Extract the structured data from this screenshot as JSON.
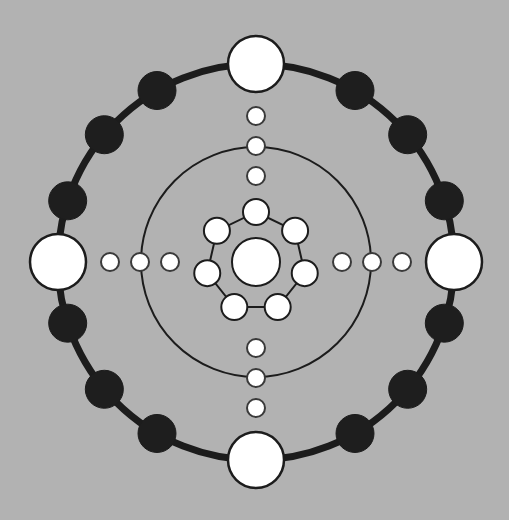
{
  "diagram": {
    "background": "#b2b2b2",
    "stroke_color": "#1c1c1c",
    "fill_white": "#ffffff",
    "fill_black": "#1e1e1e",
    "center": {
      "x": 256,
      "y": 262
    },
    "outer_ring": {
      "radius": 198,
      "stroke_width": 7
    },
    "middle_ring": {
      "radius": 115,
      "stroke_width": 2
    },
    "axis_nodes": {
      "radius": 28,
      "angles_deg": [
        270,
        90,
        180,
        0
      ],
      "names": [
        "north",
        "south",
        "west",
        "east"
      ]
    },
    "ring_black_nodes": {
      "radius": 19,
      "angles_deg": [
        300,
        320,
        342,
        18,
        40,
        60,
        120,
        140,
        162,
        198,
        220,
        240
      ]
    },
    "axis_dots": {
      "radius": 9,
      "distances": [
        86,
        116,
        146
      ]
    },
    "inner_ring": {
      "count": 7,
      "radius": 50,
      "node_radius": 13,
      "start_angle_deg": 270,
      "stroke_width": 2
    },
    "core": {
      "radius": 24
    }
  }
}
